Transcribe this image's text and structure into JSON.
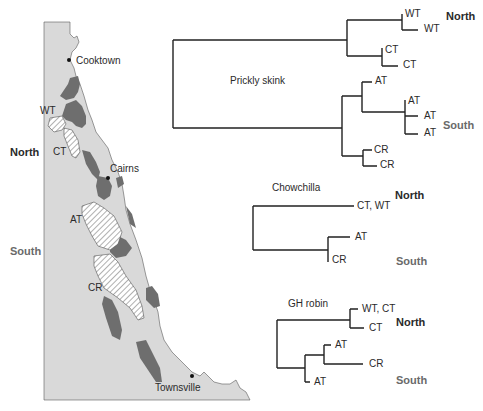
{
  "figure": {
    "map": {
      "towns": [
        {
          "name": "Cooktown"
        },
        {
          "name": "Cairns"
        },
        {
          "name": "Townsville"
        }
      ],
      "regions": [
        "WT",
        "CT",
        "AT",
        "CR"
      ],
      "side_labels": {
        "north": "North",
        "south": "South"
      },
      "colors": {
        "land": "#d9d9d9",
        "rainforest": "#6e6e6e",
        "hatched_region": "#ffffff",
        "coastline": "#5a5a5a"
      }
    },
    "trees": [
      {
        "title": "Prickly skink",
        "leaves": [
          "WT",
          "WT",
          "CT",
          "CT",
          "AT",
          "AT",
          "AT",
          "AT",
          "CR",
          "CR"
        ],
        "group_labels": {
          "north": "North",
          "south": "South"
        }
      },
      {
        "title": "Chowchilla",
        "leaves": [
          "CT, WT",
          "AT",
          "CR"
        ],
        "group_labels": {
          "north": "North",
          "south": "South"
        }
      },
      {
        "title": "GH robin",
        "leaves": [
          "WT, CT",
          "CT",
          "AT",
          "CR",
          "AT"
        ],
        "group_labels": {
          "north": "North",
          "south": "South"
        }
      }
    ]
  }
}
